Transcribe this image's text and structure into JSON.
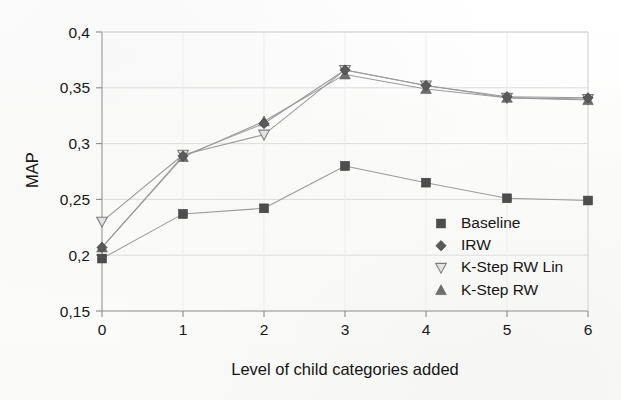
{
  "chart_data": {
    "type": "line",
    "title": "",
    "xlabel": "Level of child categories added",
    "ylabel": "MAP",
    "x": [
      0,
      1,
      2,
      3,
      4,
      5,
      6
    ],
    "xtick_labels": [
      "0",
      "1",
      "2",
      "3",
      "4",
      "5",
      "6"
    ],
    "ytick_labels": [
      "0,15",
      "0,2",
      "0,25",
      "0,3",
      "0,35",
      "0,4"
    ],
    "ytick_values": [
      0.15,
      0.2,
      0.25,
      0.3,
      0.35,
      0.4
    ],
    "xlim": [
      0,
      6
    ],
    "ylim": [
      0.15,
      0.4
    ],
    "grid": "both-faint",
    "legend_position": "inside-lower-right",
    "decimal_separator": ",",
    "series": [
      {
        "name": "Baseline",
        "marker": "filled-square",
        "color": "#4d4d4d",
        "values": [
          0.197,
          0.237,
          0.242,
          0.28,
          0.265,
          0.251,
          0.249
        ]
      },
      {
        "name": "IRW",
        "marker": "filled-diamond",
        "color": "#5a5a5a",
        "values": [
          0.207,
          0.289,
          0.318,
          0.366,
          0.352,
          0.342,
          0.341
        ]
      },
      {
        "name": "K-Step RW Lin",
        "marker": "open-down-triangle",
        "color": "#8d8d8d",
        "values": [
          0.23,
          0.29,
          0.308,
          0.366,
          0.352,
          0.341,
          0.34
        ]
      },
      {
        "name": "K-Step RW",
        "marker": "filled-up-triangle",
        "color": "#6e6e6e",
        "values": [
          0.207,
          0.288,
          0.32,
          0.362,
          0.349,
          0.341,
          0.339
        ]
      }
    ]
  },
  "legend": {
    "entries": [
      {
        "label": "Baseline",
        "marker": "filled-square"
      },
      {
        "label": "IRW",
        "marker": "filled-diamond"
      },
      {
        "label": "K-Step RW Lin",
        "marker": "open-down-triangle"
      },
      {
        "label": "K-Step RW",
        "marker": "filled-up-triangle"
      }
    ]
  },
  "axes": {
    "y_title": "MAP",
    "x_title": "Level of child categories added"
  },
  "colors": {
    "axis": "#8a8a8a",
    "grid": "#dcdcdc",
    "text": "#161616",
    "line": "#8f8f8f",
    "marker_dark": "#4d4d4d",
    "marker_mid": "#6e6e6e",
    "marker_light": "#9a9a9a"
  }
}
